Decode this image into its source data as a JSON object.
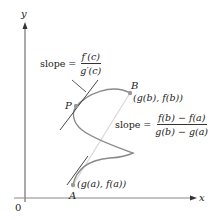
{
  "axes": {
    "x_label": "x",
    "y_label": "y",
    "origin_label": "0"
  },
  "points": {
    "A": {
      "name": "A",
      "coords": "(g(a), f(a))"
    },
    "B": {
      "name": "B",
      "coords": "(g(b), f(b))"
    },
    "P": {
      "name": "P"
    }
  },
  "annotations": {
    "tangent_slope": {
      "prefix": "slope =",
      "numerator": "f′(c)",
      "denominator": "g′(c)"
    },
    "secant_slope": {
      "prefix": "slope =",
      "numerator": "f(b) − f(a)",
      "denominator": "g(b) − g(a)"
    }
  },
  "colors": {
    "curve": "#8a8a8a",
    "axis": "#555555",
    "secant": "#d8d8d8",
    "tangent": "#333333",
    "point": "#999999"
  }
}
